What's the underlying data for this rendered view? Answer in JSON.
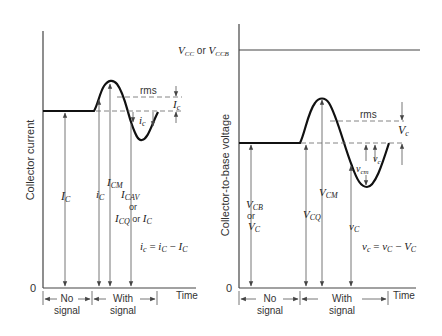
{
  "figure": {
    "left_panel": {
      "y_axis_label": "Collector current",
      "origin_label": "0",
      "x_axis_label": "Time",
      "rms_label": "rms",
      "amplitude_label": "I",
      "amplitude_sub": "c",
      "ac_label": "i",
      "ac_sub": "c",
      "dc_arrow_label": "I",
      "dc_arrow_sub": "C",
      "total_arrow_label": "i",
      "total_arrow_sub": "C",
      "peak_arrow_label": "I",
      "peak_arrow_sub": "CM",
      "avg_label_1": "I",
      "avg_label_1_sub": "CAV",
      "or_1": "or",
      "avg_label_2": "I",
      "avg_label_2_sub": "CQ",
      "or_2": " or ",
      "avg_label_3": "I",
      "avg_label_3_sub": "C",
      "equation": "i_c = i_C − I_C",
      "eq_parts": {
        "lhs": "i",
        "lhs_sub": "c",
        "eq": " = ",
        "t1": "i",
        "t1_sub": "C",
        "minus": " − ",
        "t2": "I",
        "t2_sub": "C"
      },
      "interval_no_signal": [
        "No",
        "signal"
      ],
      "interval_with_signal": [
        "With",
        "signal"
      ]
    },
    "right_panel": {
      "y_axis_label": "Collector-to-base voltage",
      "supply_label": {
        "v1": "V",
        "v1_sub": "CC",
        "or": " or ",
        "v2": "V",
        "v2_sub": "CCB"
      },
      "origin_label": "0",
      "x_axis_label": "Time",
      "rms_label": "rms",
      "amplitude_label": "V",
      "amplitude_sub": "c",
      "ac_label": "v",
      "ac_sub": "c",
      "ac_peak_label": "v",
      "ac_peak_sub": "cm",
      "dc_label_1": "V",
      "dc_label_1_sub": "CB",
      "or": "or",
      "dc_label_2": "V",
      "dc_label_2_sub": "C",
      "q_label": "V",
      "q_sub": "CQ",
      "peak_label": "V",
      "peak_sub": "CM",
      "total_label": "v",
      "total_sub": "C",
      "eq_parts": {
        "lhs": "v",
        "lhs_sub": "c",
        "eq": " = ",
        "t1": "v",
        "t1_sub": "C",
        "minus": " − ",
        "t2": "V",
        "t2_sub": "C"
      },
      "interval_no_signal": [
        "No",
        "signal"
      ],
      "interval_with_signal": [
        "With",
        "signal"
      ]
    }
  }
}
